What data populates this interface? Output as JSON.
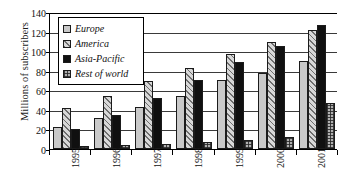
{
  "chart_data": {
    "type": "bar",
    "title": "",
    "xlabel": "",
    "ylabel": "Millions of subscribers",
    "categories": [
      "1995",
      "1996",
      "1997",
      "1998",
      "1999",
      "2000",
      "2001"
    ],
    "ylim": [
      0,
      140
    ],
    "ytick_step": 20,
    "yticks": [
      "0",
      "20",
      "40",
      "60",
      "80",
      "100",
      "120",
      "140"
    ],
    "grid": "horizontal",
    "legend_position": "top-left-inside",
    "series": [
      {
        "name": "Europe",
        "fill": "light-gray-solid",
        "color": "#c9c9c9",
        "values": [
          23,
          32,
          43,
          54,
          71,
          78,
          90
        ]
      },
      {
        "name": "America",
        "fill": "diagonal-hatch",
        "color": "#d8d8d8",
        "values": [
          42,
          54,
          70,
          83,
          97,
          109,
          122
        ]
      },
      {
        "name": "Asia-Pacific",
        "fill": "solid-black",
        "color": "#101010",
        "values": [
          20,
          35,
          52,
          71,
          89,
          105,
          127
        ]
      },
      {
        "name": "Rest of world",
        "fill": "dotted-gray",
        "color": "#b0b0b0",
        "values": [
          3,
          4,
          5,
          7,
          9,
          12,
          47
        ]
      }
    ]
  }
}
